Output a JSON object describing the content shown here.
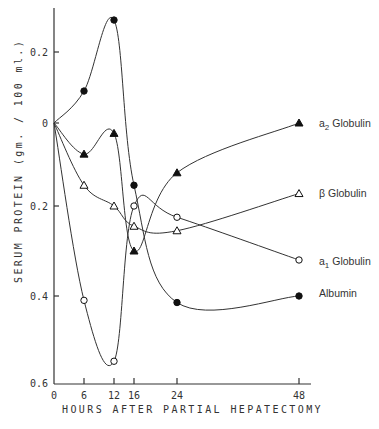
{
  "chart_data": {
    "type": "line",
    "title": "",
    "xlabel": "HOURS AFTER PARTIAL HEPATECTOMY",
    "ylabel": "SERUM PROTEIN (gm. / 100 ml.)",
    "x": [
      0,
      6,
      12,
      16,
      24,
      48
    ],
    "x_ticks": [
      "0",
      "6",
      "12",
      "16",
      "24",
      "48"
    ],
    "y_ticks": [
      {
        "value": 0.2,
        "label": "0.2"
      },
      {
        "value": 0,
        "label": "0"
      },
      {
        "value": -0.2,
        "label": "0.2"
      },
      {
        "value": -0.4,
        "label": "0.4"
      },
      {
        "value": -0.6,
        "label": "0.6"
      }
    ],
    "ylim": [
      -0.6,
      0.3
    ],
    "xlim": [
      0,
      50
    ],
    "grid": false,
    "legend_position": "right, inline at line ends",
    "series": [
      {
        "name": "a2 Globulin",
        "label_main": "a",
        "label_sub": "2",
        "label_rest": " Globulin",
        "marker": "filled-triangle",
        "values": [
          0,
          -0.075,
          -0.025,
          -0.3,
          -0.12,
          0.0
        ]
      },
      {
        "name": "β Globulin",
        "label_main": "β",
        "label_sub": "",
        "label_rest": " Globulin",
        "marker": "open-triangle",
        "values": [
          0,
          -0.15,
          -0.2,
          -0.245,
          -0.255,
          -0.17
        ]
      },
      {
        "name": "a1 Globulin",
        "label_main": "a",
        "label_sub": "1",
        "label_rest": " Globulin",
        "marker": "open-circle",
        "values": [
          0,
          -0.41,
          -0.55,
          -0.2,
          -0.225,
          -0.32
        ]
      },
      {
        "name": "Albumin",
        "label_main": "Albumin",
        "label_sub": "",
        "label_rest": "",
        "marker": "filled-circle",
        "values": [
          0,
          0.09,
          0.29,
          -0.15,
          -0.415,
          -0.4
        ]
      }
    ]
  }
}
